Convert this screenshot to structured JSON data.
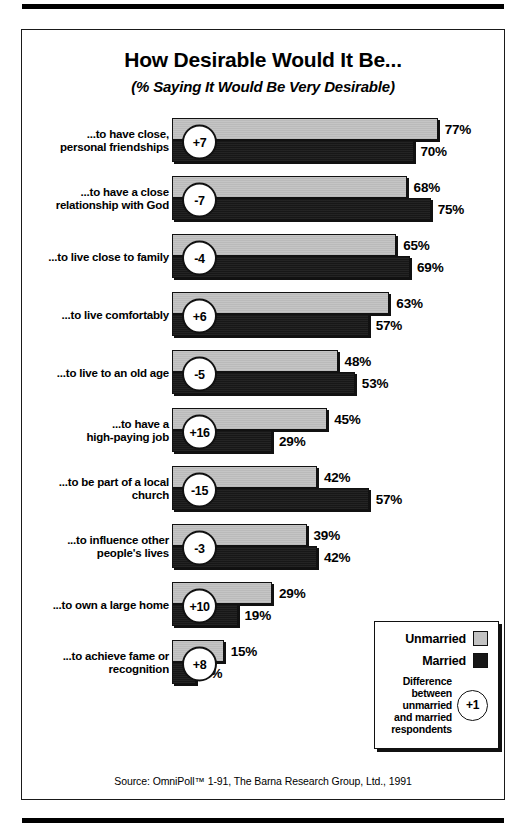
{
  "title": "How Desirable Would It Be...",
  "subtitle": "(% Saying It Would Be Very Desirable)",
  "source": "Source: OmniPoll™ 1-91, The Barna Research Group, Ltd., 1991",
  "legend": {
    "unmarried_label": "Unmarried",
    "married_label": "Married",
    "note_line1": "Difference",
    "note_line2": "between",
    "note_line3": "unmarried",
    "note_line4": "and married",
    "note_line5": "respondents",
    "note_badge": "+1"
  },
  "colors": {
    "unmarried": "#c2c2c2",
    "married": "#171717",
    "ink": "#111111",
    "paper": "#ffffff"
  },
  "chart_data": {
    "type": "bar",
    "title": "How Desirable Would It Be...",
    "subtitle": "(% Saying It Would Be Very Desirable)",
    "xlabel": "",
    "ylabel": "",
    "xlim": [
      0,
      100
    ],
    "grid": false,
    "orientation": "horizontal",
    "legend_position": "bottom-right",
    "value_suffix": "%",
    "categories": [
      "...to have close, personal friendships",
      "...to have a close relationship with God",
      "...to live close to family",
      "...to live comfortably",
      "...to live to an old age",
      "...to have a high-paying job",
      "...to be part of a local church",
      "...to influence other people's lives",
      "...to own a large home",
      "...to achieve fame or recognition"
    ],
    "series": [
      {
        "name": "Unmarried",
        "values": [
          77,
          68,
          65,
          63,
          48,
          45,
          42,
          39,
          29,
          15
        ]
      },
      {
        "name": "Married",
        "values": [
          70,
          75,
          69,
          57,
          53,
          29,
          57,
          42,
          19,
          7
        ]
      }
    ],
    "difference": [
      7,
      -7,
      -4,
      6,
      -5,
      16,
      -15,
      -3,
      10,
      8
    ]
  },
  "rows": [
    {
      "label_line1": "...to have close,",
      "label_line2": "personal friendships",
      "diff": "+7",
      "unmarried": {
        "value": 77,
        "text": "77%"
      },
      "married": {
        "value": 70,
        "text": "70%"
      }
    },
    {
      "label_line1": "...to have a close",
      "label_line2": "relationship with God",
      "diff": "-7",
      "unmarried": {
        "value": 68,
        "text": "68%"
      },
      "married": {
        "value": 75,
        "text": "75%"
      }
    },
    {
      "label_line1": "...to live close to family",
      "label_line2": "",
      "diff": "-4",
      "unmarried": {
        "value": 65,
        "text": "65%"
      },
      "married": {
        "value": 69,
        "text": "69%"
      }
    },
    {
      "label_line1": "...to live comfortably",
      "label_line2": "",
      "diff": "+6",
      "unmarried": {
        "value": 63,
        "text": "63%"
      },
      "married": {
        "value": 57,
        "text": "57%"
      }
    },
    {
      "label_line1": "...to live to an old age",
      "label_line2": "",
      "diff": "-5",
      "unmarried": {
        "value": 48,
        "text": "48%"
      },
      "married": {
        "value": 53,
        "text": "53%"
      }
    },
    {
      "label_line1": "...to have a",
      "label_line2": "high-paying job",
      "diff": "+16",
      "unmarried": {
        "value": 45,
        "text": "45%"
      },
      "married": {
        "value": 29,
        "text": "29%"
      }
    },
    {
      "label_line1": "...to be part of a local",
      "label_line2": "church",
      "diff": "-15",
      "unmarried": {
        "value": 42,
        "text": "42%"
      },
      "married": {
        "value": 57,
        "text": "57%"
      }
    },
    {
      "label_line1": "...to influence other",
      "label_line2": "people's lives",
      "diff": "-3",
      "unmarried": {
        "value": 39,
        "text": "39%"
      },
      "married": {
        "value": 42,
        "text": "42%"
      }
    },
    {
      "label_line1": "...to own a large home",
      "label_line2": "",
      "diff": "+10",
      "unmarried": {
        "value": 29,
        "text": "29%"
      },
      "married": {
        "value": 19,
        "text": "19%"
      }
    },
    {
      "label_line1": "...to achieve fame or",
      "label_line2": "recognition",
      "diff": "+8",
      "unmarried": {
        "value": 15,
        "text": "15%"
      },
      "married": {
        "value": 7,
        "text": "7%"
      }
    }
  ]
}
